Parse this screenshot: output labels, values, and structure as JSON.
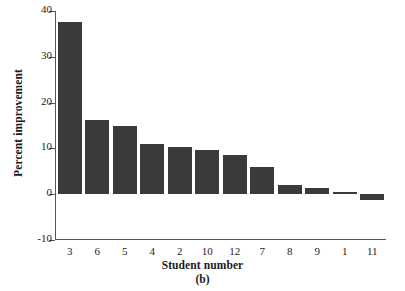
{
  "chart_data": {
    "type": "bar",
    "title": "",
    "subtitle": "",
    "xlabel": "Student number",
    "ylabel": "Percent improvement",
    "panel_label": "(b)",
    "categories": [
      "3",
      "6",
      "5",
      "4",
      "2",
      "10",
      "12",
      "7",
      "8",
      "9",
      "1",
      "11"
    ],
    "values": [
      37.5,
      16.1,
      15.0,
      11.0,
      10.4,
      9.6,
      8.5,
      5.9,
      1.9,
      1.3,
      0.5,
      -1.3
    ],
    "ylim": [
      -10,
      40
    ],
    "yticks": [
      40,
      30,
      20,
      10,
      0,
      -10
    ],
    "ytick_labels": [
      "40",
      "30",
      "20",
      "10",
      "0",
      "-10"
    ],
    "grid": false,
    "legend": false,
    "legend_position": "none",
    "bar_color": "#3a3a3a",
    "axis_color": "#555555",
    "background_color": "#ffffff",
    "series": [
      {
        "name": "Percent improvement",
        "values": [
          37.5,
          16.1,
          15.0,
          11.0,
          10.4,
          9.6,
          8.5,
          5.9,
          1.9,
          1.3,
          0.5,
          -1.3
        ]
      }
    ]
  }
}
